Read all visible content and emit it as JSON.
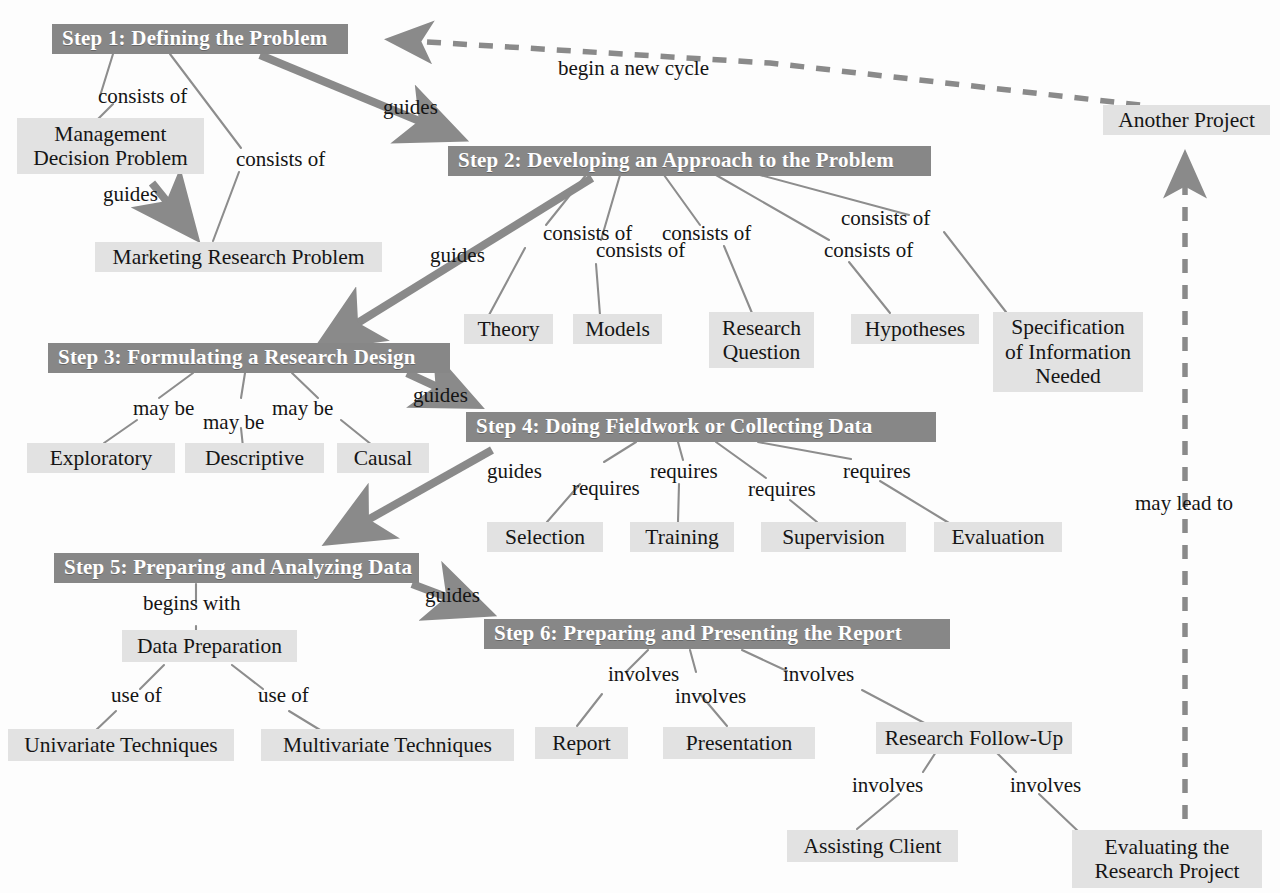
{
  "diagram": {
    "colors": {
      "step_box_fill": "#878787",
      "step_box_text": "#ffffff",
      "concept_box_fill": "#e2e2e2",
      "concept_box_text": "#151515",
      "edge_thin": "#8a8a8a",
      "edge_thick": "#8a8a8a",
      "background": "#fdfdfd"
    },
    "steps": [
      {
        "id": "step1",
        "label": "Step 1: Defining the Problem"
      },
      {
        "id": "step2",
        "label": "Step 2: Developing an Approach to the Problem"
      },
      {
        "id": "step3",
        "label": "Step 3: Formulating a Research Design"
      },
      {
        "id": "step4",
        "label": "Step 4: Doing Fieldwork or Collecting Data"
      },
      {
        "id": "step5",
        "label": "Step 5: Preparing and Analyzing Data"
      },
      {
        "id": "step6",
        "label": "Step 6: Preparing and Presenting the Report"
      }
    ],
    "concepts": [
      {
        "id": "mgmt_decision",
        "label": "Management\nDecision Problem"
      },
      {
        "id": "mkt_research",
        "label": "Marketing Research Problem"
      },
      {
        "id": "theory",
        "label": "Theory"
      },
      {
        "id": "models",
        "label": "Models"
      },
      {
        "id": "research_question",
        "label": "Research\nQuestion"
      },
      {
        "id": "hypotheses",
        "label": "Hypotheses"
      },
      {
        "id": "spec_info",
        "label": "Specification\nof Information\nNeeded"
      },
      {
        "id": "exploratory",
        "label": "Exploratory"
      },
      {
        "id": "descriptive",
        "label": "Descriptive"
      },
      {
        "id": "causal",
        "label": "Causal"
      },
      {
        "id": "selection",
        "label": "Selection"
      },
      {
        "id": "training",
        "label": "Training"
      },
      {
        "id": "supervision",
        "label": "Supervision"
      },
      {
        "id": "evaluation",
        "label": "Evaluation"
      },
      {
        "id": "data_prep",
        "label": "Data Preparation"
      },
      {
        "id": "univariate",
        "label": "Univariate Techniques"
      },
      {
        "id": "multivariate",
        "label": "Multivariate Techniques"
      },
      {
        "id": "report",
        "label": "Report"
      },
      {
        "id": "presentation",
        "label": "Presentation"
      },
      {
        "id": "follow_up",
        "label": "Research Follow-Up"
      },
      {
        "id": "assisting_client",
        "label": "Assisting Client"
      },
      {
        "id": "evaluating_project",
        "label": "Evaluating the\nResearch Project"
      },
      {
        "id": "another_project",
        "label": "Another Project"
      }
    ],
    "edge_labels": [
      {
        "id": "lbl_consists_of_1",
        "text": "consists of"
      },
      {
        "id": "lbl_consists_of_2",
        "text": "consists of"
      },
      {
        "id": "lbl_guides_1",
        "text": "guides"
      },
      {
        "id": "lbl_guides_2",
        "text": "guides"
      },
      {
        "id": "lbl_guides_3",
        "text": "guides"
      },
      {
        "id": "lbl_guides_4",
        "text": "guides"
      },
      {
        "id": "lbl_guides_5",
        "text": "guides"
      },
      {
        "id": "lbl_guides_6",
        "text": "guides"
      },
      {
        "id": "lbl_begin_new_cycle",
        "text": "begin a new cycle"
      },
      {
        "id": "lbl_consists_of_3",
        "text": "consists of"
      },
      {
        "id": "lbl_consists_of_4",
        "text": "consists of"
      },
      {
        "id": "lbl_consists_of_5",
        "text": "consists of"
      },
      {
        "id": "lbl_consists_of_6",
        "text": "consists of"
      },
      {
        "id": "lbl_consists_of_7",
        "text": "consists of"
      },
      {
        "id": "lbl_may_be_1",
        "text": "may be"
      },
      {
        "id": "lbl_may_be_2",
        "text": "may be"
      },
      {
        "id": "lbl_may_be_3",
        "text": "may be"
      },
      {
        "id": "lbl_requires_1",
        "text": "requires"
      },
      {
        "id": "lbl_requires_2",
        "text": "requires"
      },
      {
        "id": "lbl_requires_3",
        "text": "requires"
      },
      {
        "id": "lbl_requires_4",
        "text": "requires"
      },
      {
        "id": "lbl_begins_with",
        "text": "begins with"
      },
      {
        "id": "lbl_use_of_1",
        "text": "use of"
      },
      {
        "id": "lbl_use_of_2",
        "text": "use of"
      },
      {
        "id": "lbl_involves_1",
        "text": "involves"
      },
      {
        "id": "lbl_involves_2",
        "text": "involves"
      },
      {
        "id": "lbl_involves_3",
        "text": "involves"
      },
      {
        "id": "lbl_involves_4",
        "text": "involves"
      },
      {
        "id": "lbl_involves_5",
        "text": "involves"
      },
      {
        "id": "lbl_may_lead_to",
        "text": "may lead to"
      }
    ]
  }
}
